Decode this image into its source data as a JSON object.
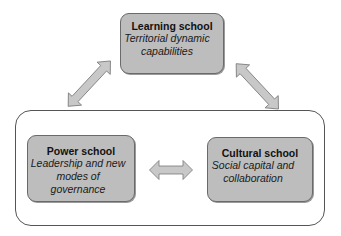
{
  "diagram": {
    "type": "conceptual-framework",
    "nodes": [
      {
        "id": "learning",
        "title": "Learning school",
        "description": "Territorial dynamic capabilities"
      },
      {
        "id": "power",
        "title": "Power school",
        "description": "Leadership and new modes of governance"
      },
      {
        "id": "cultural",
        "title": "Cultural school",
        "description": "Social capital and collaboration"
      }
    ],
    "groups": [
      {
        "id": "lower-group",
        "members": [
          "power",
          "cultural"
        ]
      }
    ],
    "edges": [
      {
        "from": "learning",
        "to": "lower-group",
        "direction": "bidirectional",
        "icon": "double-arrow-diagonal-left"
      },
      {
        "from": "learning",
        "to": "lower-group",
        "direction": "bidirectional",
        "icon": "double-arrow-diagonal-right"
      },
      {
        "from": "power",
        "to": "cultural",
        "direction": "bidirectional",
        "icon": "double-arrow-horizontal"
      }
    ],
    "colors": {
      "box_fill": "#bdbdbd",
      "box_border": "#6a6a6a",
      "arrow_fill": "#c8c8c8",
      "arrow_stroke": "#777777",
      "container_border": "#555555"
    }
  }
}
